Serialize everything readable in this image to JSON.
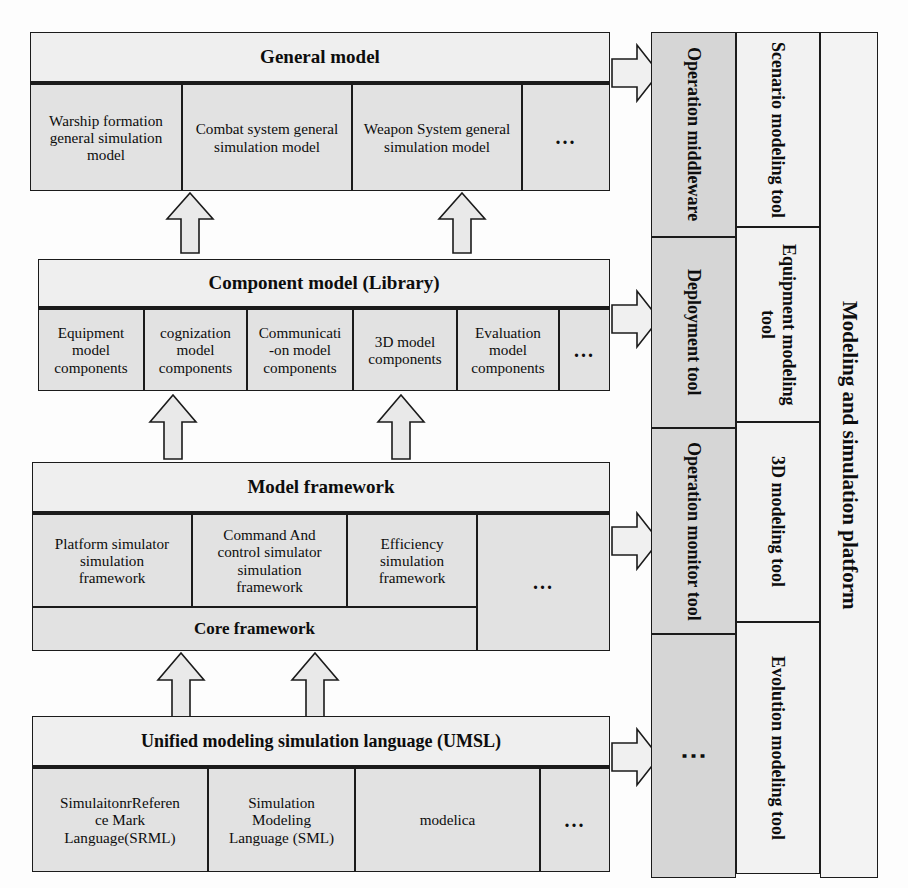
{
  "diagram": {
    "colors": {
      "box_fill": "#e3e3e3",
      "band_fill": "#efefef",
      "mid_column_fill": "#d6d6d6",
      "tool_column_fill": "#f2f2f2",
      "border": "#1b1b1b",
      "arrow_fill": "#e9e9e9"
    },
    "ellipsis": "…",
    "dots_vertical": "⋮"
  },
  "layers": [
    {
      "id": "general-model",
      "band": "General model",
      "cells": [
        "Warship formation general simulation model",
        "Combat system general simulation model",
        "Weapon System general simulation model",
        "..."
      ]
    },
    {
      "id": "component-model",
      "band": "Component model (Library)",
      "cells": [
        "Equipment model components",
        "cognization model components",
        "Communicati -on model components",
        "3D model components",
        "Evaluation model components",
        "..."
      ]
    },
    {
      "id": "model-framework",
      "band": "Model framework",
      "cells": [
        "Platform simulator simulation framework",
        "Command And control simulator simulation framework",
        "Efficiency simulation framework",
        "..."
      ],
      "footer": "Core framework"
    },
    {
      "id": "umsl",
      "band": "Unified modeling simulation language  (UMSL)",
      "cells": [
        "SimulaitonrReferen ce Mark Language(SRML)",
        "Simulation Modeling Language (SML)",
        "modelica",
        "..."
      ]
    }
  ],
  "middleware_column": [
    "Operation middleware",
    "Deployment tool",
    "Operation monitor tool",
    "⋮"
  ],
  "tools_column": [
    "Scenario modeling tool",
    "Equipment modeling tool",
    "3D modeling tool",
    "Evolution modeling tool"
  ],
  "platform_column": {
    "label": "Modeling and simulation platform"
  },
  "cell_lines": {
    "warship": [
      "Warship formation",
      "general simulation",
      "model"
    ],
    "combat": [
      "Combat system general",
      "simulation model"
    ],
    "weapon": [
      "Weapon System general",
      "simulation model"
    ],
    "equipment_comp": [
      "Equipment",
      "model",
      "components"
    ],
    "cognization": [
      "cognization",
      "model",
      "components"
    ],
    "communication": [
      "Communicati",
      "-on model",
      "components"
    ],
    "threed": [
      "3D model",
      "components"
    ],
    "evaluation": [
      "Evaluation",
      "model",
      "components"
    ],
    "platform_sim": [
      "Platform simulator",
      "simulation",
      "framework"
    ],
    "command": [
      "Command And",
      "control simulator",
      "simulation",
      "framework"
    ],
    "efficiency": [
      "Efficiency",
      "simulation",
      "framework"
    ],
    "srml": [
      "SimulaitonrReferen",
      "ce Mark",
      "Language(SRML)"
    ],
    "sml": [
      "Simulation",
      "Modeling",
      "Language (SML)"
    ]
  }
}
